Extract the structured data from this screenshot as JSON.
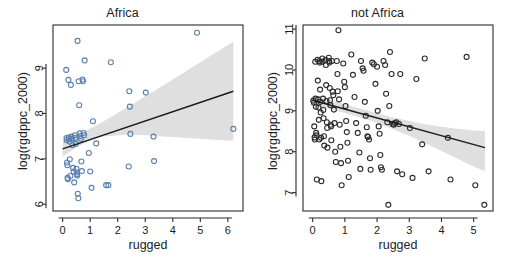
{
  "figure": {
    "width": 510,
    "height": 263,
    "background": "#ffffff",
    "panel_count": 2
  },
  "chart_data": [
    {
      "type": "scatter",
      "title": "Africa",
      "xlabel": "rugged",
      "ylabel": "log(rgdppc_2000)",
      "xlim": [
        -0.35,
        6.55
      ],
      "ylim": [
        5.85,
        9.95
      ],
      "xticks": [
        0,
        1,
        2,
        3,
        4,
        5,
        6
      ],
      "yticks": [
        6,
        7,
        8,
        9
      ],
      "grid": false,
      "legend": "none",
      "point_color": "#5b7fae",
      "point_style": "open-circle",
      "fit_line": {
        "type": "linear",
        "color": "#1a1a1a",
        "x": [
          0.0,
          6.2
        ],
        "y": [
          7.22,
          8.49
        ]
      },
      "confidence_band": {
        "color": "#d9d9d9",
        "x": [
          0.0,
          0.5,
          1.0,
          1.5,
          2.0,
          2.5,
          3.0,
          3.5,
          4.0,
          4.5,
          5.0,
          5.5,
          6.2
        ],
        "upper": [
          7.4,
          7.52,
          7.67,
          7.83,
          8.01,
          8.19,
          8.38,
          8.56,
          8.75,
          8.94,
          9.13,
          9.32,
          9.58
        ],
        "lower": [
          7.04,
          7.26,
          7.41,
          7.49,
          7.52,
          7.53,
          7.52,
          7.5,
          7.48,
          7.46,
          7.44,
          7.42,
          7.4
        ]
      },
      "points": [
        {
          "x": 0.13,
          "y": 8.96
        },
        {
          "x": 0.14,
          "y": 7.46
        },
        {
          "x": 0.15,
          "y": 7.41
        },
        {
          "x": 0.16,
          "y": 6.92
        },
        {
          "x": 0.17,
          "y": 6.86
        },
        {
          "x": 0.18,
          "y": 6.58
        },
        {
          "x": 0.19,
          "y": 6.55
        },
        {
          "x": 0.21,
          "y": 8.74
        },
        {
          "x": 0.22,
          "y": 7.47
        },
        {
          "x": 0.23,
          "y": 7.43
        },
        {
          "x": 0.25,
          "y": 7.38
        },
        {
          "x": 0.26,
          "y": 6.99
        },
        {
          "x": 0.28,
          "y": 6.62
        },
        {
          "x": 0.3,
          "y": 8.63
        },
        {
          "x": 0.32,
          "y": 7.49
        },
        {
          "x": 0.34,
          "y": 7.44
        },
        {
          "x": 0.36,
          "y": 7.3
        },
        {
          "x": 0.38,
          "y": 6.8
        },
        {
          "x": 0.4,
          "y": 6.72
        },
        {
          "x": 0.42,
          "y": 6.48
        },
        {
          "x": 0.44,
          "y": 7.52
        },
        {
          "x": 0.46,
          "y": 7.46
        },
        {
          "x": 0.48,
          "y": 7.33
        },
        {
          "x": 0.5,
          "y": 6.78
        },
        {
          "x": 0.51,
          "y": 6.7
        },
        {
          "x": 0.52,
          "y": 6.66
        },
        {
          "x": 0.53,
          "y": 6.63
        },
        {
          "x": 0.54,
          "y": 9.6
        },
        {
          "x": 0.55,
          "y": 6.23
        },
        {
          "x": 0.57,
          "y": 6.13
        },
        {
          "x": 0.58,
          "y": 8.71
        },
        {
          "x": 0.6,
          "y": 8.18
        },
        {
          "x": 0.62,
          "y": 7.56
        },
        {
          "x": 0.64,
          "y": 7.5
        },
        {
          "x": 0.66,
          "y": 7.44
        },
        {
          "x": 0.68,
          "y": 6.94
        },
        {
          "x": 0.7,
          "y": 6.73
        },
        {
          "x": 0.72,
          "y": 8.75
        },
        {
          "x": 0.74,
          "y": 8.71
        },
        {
          "x": 0.76,
          "y": 7.57
        },
        {
          "x": 0.78,
          "y": 7.52
        },
        {
          "x": 0.8,
          "y": 9.17
        },
        {
          "x": 0.95,
          "y": 7.13
        },
        {
          "x": 1.0,
          "y": 6.72
        },
        {
          "x": 1.05,
          "y": 6.36
        },
        {
          "x": 1.1,
          "y": 7.83
        },
        {
          "x": 1.22,
          "y": 7.34
        },
        {
          "x": 1.58,
          "y": 6.42
        },
        {
          "x": 1.66,
          "y": 6.42
        },
        {
          "x": 1.75,
          "y": 9.13
        },
        {
          "x": 2.4,
          "y": 6.83
        },
        {
          "x": 2.42,
          "y": 8.49
        },
        {
          "x": 2.44,
          "y": 8.15
        },
        {
          "x": 2.46,
          "y": 7.55
        },
        {
          "x": 3.02,
          "y": 8.46
        },
        {
          "x": 3.3,
          "y": 7.49
        },
        {
          "x": 3.32,
          "y": 6.95
        },
        {
          "x": 4.88,
          "y": 9.78
        },
        {
          "x": 6.2,
          "y": 7.66
        }
      ]
    },
    {
      "type": "scatter",
      "title": "not Africa",
      "xlabel": "rugged",
      "ylabel": "log(rgdppc_2000)",
      "xlim": [
        -0.3,
        5.6
      ],
      "ylim": [
        6.55,
        11.1
      ],
      "xticks": [
        0,
        1,
        2,
        3,
        4,
        5
      ],
      "yticks": [
        7,
        8,
        9,
        10,
        11
      ],
      "grid": false,
      "legend": "none",
      "point_color": "#2b2b2b",
      "point_style": "open-circle",
      "fit_line": {
        "type": "linear",
        "color": "#1a1a1a",
        "x": [
          0.0,
          5.35
        ],
        "y": [
          9.26,
          8.1
        ]
      },
      "confidence_band": {
        "color": "#d9d9d9",
        "x": [
          0.0,
          0.5,
          1.0,
          1.5,
          2.0,
          2.5,
          3.0,
          3.5,
          4.0,
          4.5,
          5.0,
          5.35
        ],
        "upper": [
          9.38,
          9.27,
          9.16,
          9.05,
          8.94,
          8.84,
          8.75,
          8.67,
          8.61,
          8.56,
          8.52,
          8.5
        ],
        "lower": [
          9.14,
          9.05,
          8.95,
          8.83,
          8.7,
          8.55,
          8.39,
          8.21,
          8.02,
          7.83,
          7.64,
          7.52
        ]
      },
      "points": [
        {
          "x": 0.02,
          "y": 9.25
        },
        {
          "x": 0.04,
          "y": 9.2
        },
        {
          "x": 0.05,
          "y": 8.62
        },
        {
          "x": 0.06,
          "y": 8.35
        },
        {
          "x": 0.07,
          "y": 8.3
        },
        {
          "x": 0.08,
          "y": 10.2
        },
        {
          "x": 0.09,
          "y": 9.3
        },
        {
          "x": 0.1,
          "y": 9.1
        },
        {
          "x": 0.11,
          "y": 8.46
        },
        {
          "x": 0.12,
          "y": 8.4
        },
        {
          "x": 0.13,
          "y": 7.32
        },
        {
          "x": 0.15,
          "y": 10.25
        },
        {
          "x": 0.16,
          "y": 9.74
        },
        {
          "x": 0.17,
          "y": 9.28
        },
        {
          "x": 0.18,
          "y": 9.08
        },
        {
          "x": 0.19,
          "y": 8.78
        },
        {
          "x": 0.2,
          "y": 8.3
        },
        {
          "x": 0.21,
          "y": 10.22
        },
        {
          "x": 0.22,
          "y": 10.18
        },
        {
          "x": 0.23,
          "y": 9.52
        },
        {
          "x": 0.24,
          "y": 9.22
        },
        {
          "x": 0.25,
          "y": 8.96
        },
        {
          "x": 0.26,
          "y": 8.34
        },
        {
          "x": 0.27,
          "y": 7.28
        },
        {
          "x": 0.3,
          "y": 10.28
        },
        {
          "x": 0.31,
          "y": 10.2
        },
        {
          "x": 0.32,
          "y": 9.3
        },
        {
          "x": 0.33,
          "y": 9.02
        },
        {
          "x": 0.34,
          "y": 8.82
        },
        {
          "x": 0.35,
          "y": 8.38
        },
        {
          "x": 0.36,
          "y": 8.15
        },
        {
          "x": 0.4,
          "y": 10.24
        },
        {
          "x": 0.41,
          "y": 10.12
        },
        {
          "x": 0.42,
          "y": 9.63
        },
        {
          "x": 0.43,
          "y": 9.24
        },
        {
          "x": 0.44,
          "y": 8.72
        },
        {
          "x": 0.45,
          "y": 8.58
        },
        {
          "x": 0.46,
          "y": 8.1
        },
        {
          "x": 0.5,
          "y": 10.3
        },
        {
          "x": 0.51,
          "y": 10.22
        },
        {
          "x": 0.52,
          "y": 10.18
        },
        {
          "x": 0.53,
          "y": 9.56
        },
        {
          "x": 0.54,
          "y": 9.26
        },
        {
          "x": 0.55,
          "y": 9.14
        },
        {
          "x": 0.56,
          "y": 8.66
        },
        {
          "x": 0.57,
          "y": 8.62
        },
        {
          "x": 0.58,
          "y": 8.28
        },
        {
          "x": 0.6,
          "y": 10.22
        },
        {
          "x": 0.62,
          "y": 9.47
        },
        {
          "x": 0.64,
          "y": 9.38
        },
        {
          "x": 0.66,
          "y": 9.03
        },
        {
          "x": 0.68,
          "y": 8.7
        },
        {
          "x": 0.7,
          "y": 8.0
        },
        {
          "x": 0.72,
          "y": 7.75
        },
        {
          "x": 0.75,
          "y": 10.22
        },
        {
          "x": 0.77,
          "y": 9.9
        },
        {
          "x": 0.78,
          "y": 9.48
        },
        {
          "x": 0.8,
          "y": 10.97
        },
        {
          "x": 0.82,
          "y": 9.28
        },
        {
          "x": 0.84,
          "y": 8.66
        },
        {
          "x": 0.86,
          "y": 8.12
        },
        {
          "x": 0.88,
          "y": 7.72
        },
        {
          "x": 0.9,
          "y": 7.18
        },
        {
          "x": 0.95,
          "y": 10.16
        },
        {
          "x": 0.98,
          "y": 9.71
        },
        {
          "x": 1.0,
          "y": 9.58
        },
        {
          "x": 1.02,
          "y": 9.12
        },
        {
          "x": 1.04,
          "y": 8.75
        },
        {
          "x": 1.06,
          "y": 8.48
        },
        {
          "x": 1.08,
          "y": 8.22
        },
        {
          "x": 1.1,
          "y": 7.78
        },
        {
          "x": 1.12,
          "y": 7.38
        },
        {
          "x": 1.2,
          "y": 10.38
        },
        {
          "x": 1.25,
          "y": 9.88
        },
        {
          "x": 1.3,
          "y": 9.34
        },
        {
          "x": 1.35,
          "y": 8.7
        },
        {
          "x": 1.4,
          "y": 8.46
        },
        {
          "x": 1.45,
          "y": 7.98
        },
        {
          "x": 1.48,
          "y": 7.58
        },
        {
          "x": 1.5,
          "y": 10.22
        },
        {
          "x": 1.55,
          "y": 10.04
        },
        {
          "x": 1.58,
          "y": 9.98
        },
        {
          "x": 1.62,
          "y": 9.22
        },
        {
          "x": 1.65,
          "y": 8.88
        },
        {
          "x": 1.68,
          "y": 8.6
        },
        {
          "x": 1.7,
          "y": 8.38
        },
        {
          "x": 1.72,
          "y": 8.36
        },
        {
          "x": 1.75,
          "y": 8.3
        },
        {
          "x": 1.78,
          "y": 7.84
        },
        {
          "x": 1.8,
          "y": 7.56
        },
        {
          "x": 1.85,
          "y": 10.18
        },
        {
          "x": 1.9,
          "y": 10.14
        },
        {
          "x": 1.95,
          "y": 9.66
        },
        {
          "x": 2.0,
          "y": 10.08
        },
        {
          "x": 2.02,
          "y": 9.0
        },
        {
          "x": 2.05,
          "y": 8.62
        },
        {
          "x": 2.08,
          "y": 8.44
        },
        {
          "x": 2.1,
          "y": 7.92
        },
        {
          "x": 2.12,
          "y": 7.62
        },
        {
          "x": 2.15,
          "y": 7.56
        },
        {
          "x": 2.2,
          "y": 10.22
        },
        {
          "x": 2.25,
          "y": 10.12
        },
        {
          "x": 2.28,
          "y": 9.42
        },
        {
          "x": 2.32,
          "y": 8.72
        },
        {
          "x": 2.35,
          "y": 6.7
        },
        {
          "x": 2.38,
          "y": 9.12
        },
        {
          "x": 2.4,
          "y": 10.44
        },
        {
          "x": 2.45,
          "y": 9.9
        },
        {
          "x": 2.48,
          "y": 8.68
        },
        {
          "x": 2.52,
          "y": 8.66
        },
        {
          "x": 2.55,
          "y": 8.7
        },
        {
          "x": 2.6,
          "y": 8.72
        },
        {
          "x": 2.62,
          "y": 7.52
        },
        {
          "x": 2.68,
          "y": 8.68
        },
        {
          "x": 2.72,
          "y": 9.9
        },
        {
          "x": 2.78,
          "y": 7.45
        },
        {
          "x": 3.02,
          "y": 8.58
        },
        {
          "x": 3.1,
          "y": 7.36
        },
        {
          "x": 3.22,
          "y": 9.78
        },
        {
          "x": 3.4,
          "y": 8.18
        },
        {
          "x": 3.48,
          "y": 10.28
        },
        {
          "x": 3.6,
          "y": 7.52
        },
        {
          "x": 4.2,
          "y": 8.34
        },
        {
          "x": 4.28,
          "y": 7.32
        },
        {
          "x": 4.78,
          "y": 10.32
        },
        {
          "x": 5.05,
          "y": 7.18
        },
        {
          "x": 5.33,
          "y": 6.7
        }
      ]
    }
  ]
}
